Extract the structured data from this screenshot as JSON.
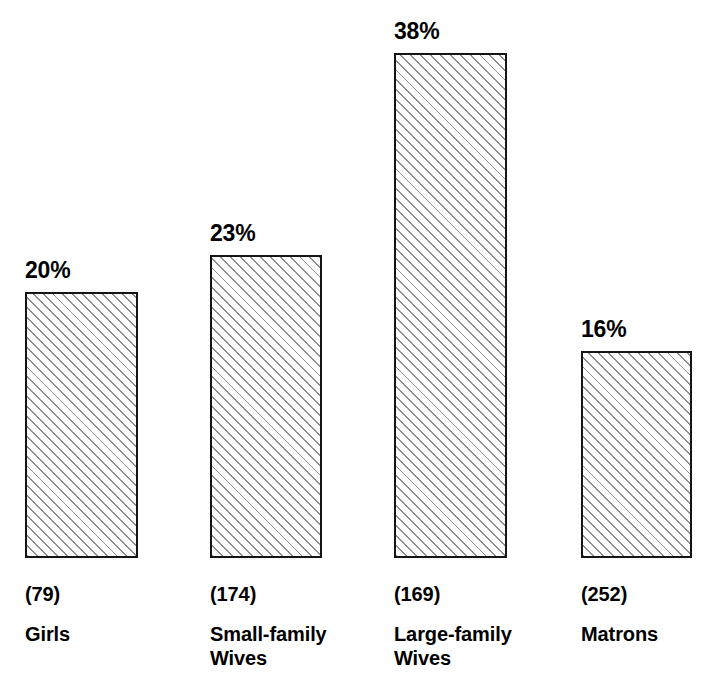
{
  "chart_data": {
    "type": "bar",
    "title": "",
    "subtitle": "",
    "xlabel": "",
    "ylabel": "",
    "grid": false,
    "legend": null,
    "ylim": [
      0,
      40
    ],
    "orientation": "vertical",
    "bar_fill": "diagonal-hatch",
    "bar_border_color": "#141414",
    "hatch_color": "#8e8e8e",
    "background_color": "#ffffff",
    "categories": [
      "Girls",
      "Small-family Wives",
      "Large-family Wives",
      "Matrons"
    ],
    "values": [
      20,
      23,
      38,
      16
    ],
    "value_labels": [
      "20%",
      "23%",
      "38%",
      "16%"
    ],
    "counts": [
      79,
      174,
      169,
      252
    ],
    "count_labels": [
      "(79)",
      "(174)",
      "(169)",
      "(252)"
    ],
    "bars": [
      {
        "category": "Girls",
        "category_lines": [
          "Girls"
        ],
        "value": 20,
        "value_label": "20%",
        "count": 79,
        "count_label": "(79)",
        "left": 25,
        "width": 113,
        "top": 292,
        "height": 266
      },
      {
        "category": "Small-family Wives",
        "category_lines": [
          "Small-family",
          "Wives"
        ],
        "value": 23,
        "value_label": "23%",
        "count": 174,
        "count_label": "(174)",
        "left": 210,
        "width": 112,
        "top": 255,
        "height": 303
      },
      {
        "category": "Large-family Wives",
        "category_lines": [
          "Large-family",
          "Wives"
        ],
        "value": 38,
        "value_label": "38%",
        "count": 169,
        "count_label": "(169)",
        "left": 394,
        "width": 113,
        "top": 53,
        "height": 505
      },
      {
        "category": "Matrons",
        "category_lines": [
          "Matrons"
        ],
        "value": 16,
        "value_label": "16%",
        "count": 252,
        "count_label": "(252)",
        "left": 581,
        "width": 111,
        "top": 351,
        "height": 207
      }
    ],
    "baseline_y": 558
  }
}
